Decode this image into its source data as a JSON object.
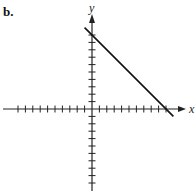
{
  "panel_label": "b.",
  "axes": {
    "x_label": "x",
    "y_label": "y"
  },
  "chart_data": {
    "type": "line",
    "title": "",
    "xlabel": "x",
    "ylabel": "y",
    "xlim": [
      -10,
      10
    ],
    "ylim": [
      -10,
      10
    ],
    "tick_step": 1,
    "tick_labels": false,
    "grid": false,
    "series": [
      {
        "name": "line",
        "equation": "y = -x + 10",
        "x": [
          -1,
          0,
          10,
          11
        ],
        "y": [
          11,
          10,
          0,
          -1
        ]
      }
    ],
    "intercepts": {
      "y_intercept": [
        0,
        10
      ],
      "x_intercept": [
        10,
        0
      ]
    }
  },
  "colors": {
    "axis": "#222222",
    "line": "#111111"
  }
}
